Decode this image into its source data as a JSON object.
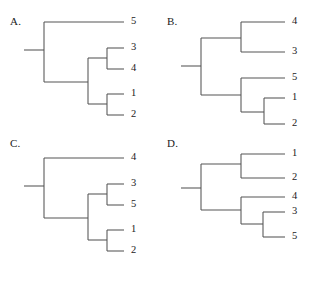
{
  "figure": {
    "type": "phylogenetic-tree-panel-figure",
    "panel_count": 4,
    "background_color": "#ffffff",
    "line_color": "#545454",
    "text_color": "#1b1b1b"
  },
  "panels": [
    {
      "id": "A",
      "letter": "A.",
      "position": "top-left",
      "tips": [
        {
          "label": "5",
          "row": 0
        },
        {
          "label": "3",
          "row": 1
        },
        {
          "label": "4",
          "row": 2
        },
        {
          "label": "1",
          "row": 3
        },
        {
          "label": "2",
          "row": 4
        }
      ],
      "topology": "(5,((3,4),(1,2)))",
      "clades": [
        {
          "name": "cherry-3-4",
          "members": [
            "3",
            "4"
          ]
        },
        {
          "name": "cherry-1-2",
          "members": [
            "1",
            "2"
          ]
        },
        {
          "name": "clade-3-4-1-2",
          "members": [
            "3",
            "4",
            "1",
            "2"
          ]
        },
        {
          "name": "root",
          "members": [
            "5",
            "3",
            "4",
            "1",
            "2"
          ]
        }
      ]
    },
    {
      "id": "B",
      "letter": "B.",
      "position": "top-right",
      "tips": [
        {
          "label": "4",
          "row": 0
        },
        {
          "label": "3",
          "row": 1
        },
        {
          "label": "5",
          "row": 2
        },
        {
          "label": "1",
          "row": 3
        },
        {
          "label": "2",
          "row": 4
        }
      ],
      "topology": "((4,3),(5,(1,2)))",
      "clades": [
        {
          "name": "cherry-4-3",
          "members": [
            "4",
            "3"
          ]
        },
        {
          "name": "cherry-1-2",
          "members": [
            "1",
            "2"
          ]
        },
        {
          "name": "clade-5-1-2",
          "members": [
            "5",
            "1",
            "2"
          ]
        },
        {
          "name": "root",
          "members": [
            "4",
            "3",
            "5",
            "1",
            "2"
          ]
        }
      ]
    },
    {
      "id": "C",
      "letter": "C.",
      "position": "bottom-left",
      "tips": [
        {
          "label": "4",
          "row": 0
        },
        {
          "label": "3",
          "row": 1
        },
        {
          "label": "5",
          "row": 2
        },
        {
          "label": "1",
          "row": 3
        },
        {
          "label": "2",
          "row": 4
        }
      ],
      "topology": "(4,((3,5),(1,2)))",
      "clades": [
        {
          "name": "cherry-3-5",
          "members": [
            "3",
            "5"
          ]
        },
        {
          "name": "cherry-1-2",
          "members": [
            "1",
            "2"
          ]
        },
        {
          "name": "clade-3-5-1-2",
          "members": [
            "3",
            "5",
            "1",
            "2"
          ]
        },
        {
          "name": "root",
          "members": [
            "4",
            "3",
            "5",
            "1",
            "2"
          ]
        }
      ]
    },
    {
      "id": "D",
      "letter": "D.",
      "position": "bottom-right",
      "tips": [
        {
          "label": "1",
          "row": 0
        },
        {
          "label": "2",
          "row": 1
        },
        {
          "label": "4",
          "row": 2
        },
        {
          "label": "3",
          "row": 3
        },
        {
          "label": "5",
          "row": 4
        }
      ],
      "topology": "((1,2),(4,(3,5)))",
      "clades": [
        {
          "name": "cherry-1-2",
          "members": [
            "1",
            "2"
          ]
        },
        {
          "name": "cherry-3-5",
          "members": [
            "3",
            "5"
          ]
        },
        {
          "name": "clade-4-3-5",
          "members": [
            "4",
            "3",
            "5"
          ]
        },
        {
          "name": "root",
          "members": [
            "1",
            "2",
            "4",
            "3",
            "5"
          ]
        }
      ]
    }
  ]
}
